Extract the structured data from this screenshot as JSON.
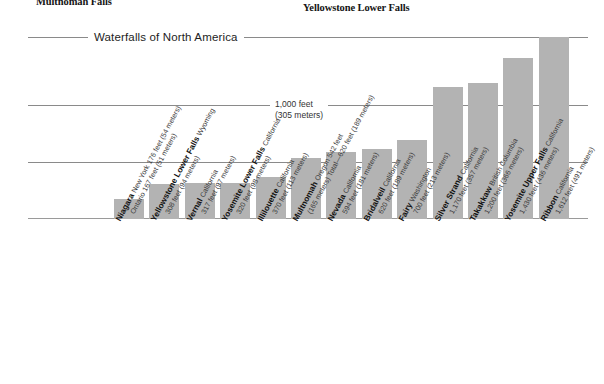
{
  "page": {
    "heading_left": "Multnomah Falls",
    "heading_right": "Yellowstone Lower Falls"
  },
  "chart_data": {
    "type": "bar",
    "title": "Waterfalls of North America",
    "xlabel": "",
    "ylabel": "",
    "ylim": [
      0,
      1700
    ],
    "grid": true,
    "legend": null,
    "annotations": [
      {
        "text": "1,000 feet",
        "text_line2": "(305 meters)",
        "value": 1000
      }
    ],
    "gridline_values": [
      1600,
      1000,
      500,
      0
    ],
    "unit_primary": "feet",
    "unit_secondary": "meters",
    "categories": [
      "Niagara",
      "Yellowstone Lower Falls",
      "Vernal",
      "Yosemite Lower Falls",
      "Illilouette",
      "Multnomah",
      "Nevada",
      "Bridalveil",
      "Fairy",
      "Silver Strand",
      "Takakkaw",
      "Yosemite Upper Falls",
      "Ribbon"
    ],
    "values": [
      176,
      308,
      317,
      320,
      370,
      542,
      594,
      620,
      700,
      1170,
      1200,
      1430,
      1612
    ],
    "values_meters": [
      54,
      94,
      97,
      98,
      113,
      165,
      181,
      189,
      213,
      357,
      366,
      436,
      491
    ],
    "points": [
      {
        "name": "Niagara",
        "detail": "New York 176 feet (54 meters)",
        "sub": "Ontario 167 feet (51 meters)",
        "feet": 176,
        "meters": 54
      },
      {
        "name": "Yellowstone Lower Falls",
        "detail": "Wyoming",
        "sub": "308 feet (94 meters)",
        "feet": 308,
        "meters": 94
      },
      {
        "name": "Vernal",
        "detail": "California",
        "sub": "317 feet (97 meters)",
        "feet": 317,
        "meters": 97
      },
      {
        "name": "Yosemite Lower Falls",
        "detail": "California",
        "sub": "320 feet (98 meters)",
        "feet": 320,
        "meters": 98
      },
      {
        "name": "Illilouette",
        "detail": "California",
        "sub": "370 feet (113 meters)",
        "feet": 370,
        "meters": 113
      },
      {
        "name": "Multnomah",
        "detail": "Oregon 542 feet",
        "sub": "(165 meters) Total—620 feet (189 meters)",
        "feet": 542,
        "meters": 165
      },
      {
        "name": "Nevada",
        "detail": "California",
        "sub": "594 feet (181 meters)",
        "feet": 594,
        "meters": 181
      },
      {
        "name": "Bridalveil",
        "detail": "California",
        "sub": "620 feet (189 meters)",
        "feet": 620,
        "meters": 189
      },
      {
        "name": "Fairy",
        "detail": "Washington",
        "sub": "700 feet (213 meters)",
        "feet": 700,
        "meters": 213
      },
      {
        "name": "Silver Strand",
        "detail": "California",
        "sub": "1,170 feet (357 meters)",
        "feet": 1170,
        "meters": 357
      },
      {
        "name": "Takakkaw",
        "detail": "British Columbia",
        "sub": "1,200 feet (366 meters)",
        "feet": 1200,
        "meters": 366
      },
      {
        "name": "Yosemite Upper Falls",
        "detail": "California",
        "sub": "1,430 feet (436 meters)",
        "feet": 1430,
        "meters": 436
      },
      {
        "name": "Ribbon",
        "detail": "California",
        "sub": "1,612 feet (491 meters)",
        "feet": 1612,
        "meters": 491
      }
    ],
    "colors": {
      "bar": "#b3b3b3",
      "gridline": "#8a8a8a",
      "background": "#ffffff",
      "text": "#1a1a1a"
    }
  }
}
